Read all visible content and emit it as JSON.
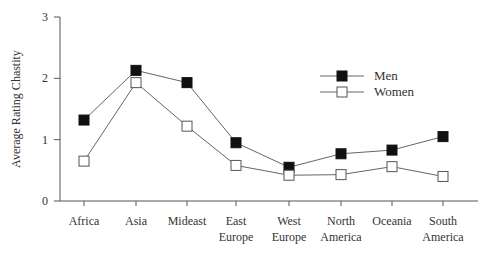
{
  "chart_data": {
    "type": "line",
    "title": "",
    "xlabel": "",
    "ylabel": "Average Rating Chastity",
    "ylim": [
      0,
      3
    ],
    "yticks": [
      0,
      1,
      2,
      3
    ],
    "grid": false,
    "legend_position": "upper right",
    "categories": [
      [
        "Africa"
      ],
      [
        "Asia"
      ],
      [
        "Mideast"
      ],
      [
        "East",
        "Europe"
      ],
      [
        "West",
        "Europe"
      ],
      [
        "North",
        "America"
      ],
      [
        "Oceania"
      ],
      [
        "South",
        "America"
      ]
    ],
    "category_names": [
      "Africa",
      "Asia",
      "Mideast",
      "East Europe",
      "West Europe",
      "North America",
      "Oceania",
      "South America"
    ],
    "series": [
      {
        "name": "Men",
        "marker": "filled-square",
        "color": "#000000",
        "values": [
          1.32,
          2.13,
          1.93,
          0.95,
          0.55,
          0.77,
          0.83,
          1.05
        ]
      },
      {
        "name": "Women",
        "marker": "open-square",
        "color": "#ffffff",
        "values": [
          0.65,
          1.93,
          1.22,
          0.58,
          0.42,
          0.43,
          0.56,
          0.4
        ]
      }
    ]
  },
  "layout": {
    "y_axis_x": 60,
    "y_zero_px": 201,
    "y_top_px": 17,
    "x_axis_end": 478,
    "x_positions": [
      84,
      136,
      187,
      236,
      289,
      341,
      392,
      443
    ],
    "legend": {
      "x": 320,
      "y": 76,
      "line_len": 44,
      "row_gap": 16
    }
  }
}
